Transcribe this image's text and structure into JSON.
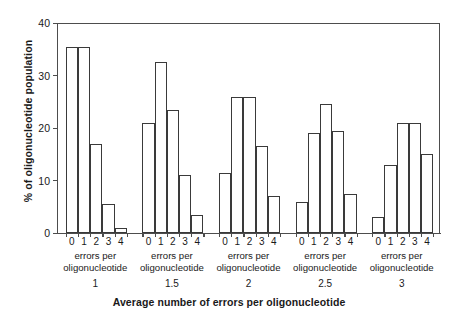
{
  "chart_data": {
    "type": "bar",
    "title": "",
    "xlabel": "Average number of errors per oligonucleotide",
    "ylabel": "% of oligonucleotide population",
    "ylim": [
      0,
      40
    ],
    "yticks": [
      0,
      10,
      20,
      30,
      40
    ],
    "ytick_labels": [
      "0",
      "10",
      "20",
      "30",
      "40"
    ],
    "categories": [
      "0",
      "1",
      "2",
      "3",
      "4"
    ],
    "group_caption_line1": "errors per",
    "group_caption_line2": "oligonucleotide",
    "grid": false,
    "legend": "none",
    "bar_style": {
      "fill": "#ffffff",
      "edge": "#3a3a3a"
    },
    "groups": [
      {
        "name": "1",
        "value_label": "1",
        "caption_line1": "errors per",
        "caption_line2": "oligonucleotide",
        "categories": [
          "0",
          "1",
          "2",
          "3",
          "4"
        ],
        "values": [
          35.5,
          35.5,
          17,
          5.5,
          1
        ]
      },
      {
        "name": "1.5",
        "value_label": "1.5",
        "caption_line1": "errors per",
        "caption_line2": "oligonucleotide",
        "categories": [
          "0",
          "1",
          "2",
          "3",
          "4"
        ],
        "values": [
          21,
          32.5,
          23.5,
          11,
          3.5
        ]
      },
      {
        "name": "2",
        "value_label": "2",
        "caption_line1": "errors per",
        "caption_line2": "oligonucleotide",
        "categories": [
          "0",
          "1",
          "2",
          "3",
          "4"
        ],
        "values": [
          11.5,
          26,
          26,
          16.5,
          7
        ]
      },
      {
        "name": "2.5",
        "value_label": "2.5",
        "caption_line1": "errors per",
        "caption_line2": "oligonucleotide",
        "categories": [
          "0",
          "1",
          "2",
          "3",
          "4"
        ],
        "values": [
          6,
          19,
          24.5,
          19.5,
          7.5
        ]
      },
      {
        "name": "3",
        "value_label": "3",
        "caption_line1": "errors per",
        "caption_line2": "oligonucleotide",
        "categories": [
          "0",
          "1",
          "2",
          "3",
          "4"
        ],
        "values": [
          3,
          13,
          21,
          21,
          15
        ]
      }
    ]
  }
}
